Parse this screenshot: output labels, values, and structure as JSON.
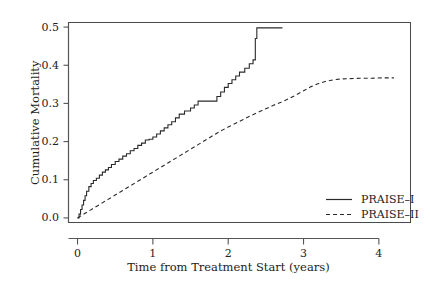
{
  "chart_data": {
    "type": "line",
    "title": "",
    "xlabel": "Time from Treatment Start (years)",
    "ylabel": "Cumulative Mortality",
    "xlim": [
      -0.12,
      4.42
    ],
    "ylim": [
      -0.012,
      0.512
    ],
    "xticks": [
      0,
      1,
      2,
      3,
      4
    ],
    "xticklabels": [
      "0",
      "1",
      "2",
      "3",
      "4"
    ],
    "yticks": [
      0.0,
      0.1,
      0.2,
      0.3,
      0.4,
      0.5
    ],
    "yticklabels": [
      "0.0",
      "0.1",
      "0.2",
      "0.3",
      "0.4",
      "0.5"
    ],
    "grid": false,
    "legend_position": "lower right",
    "frame": true,
    "series": [
      {
        "name": "PRAISE–I",
        "style": "solid",
        "drawstyle": "steps-post",
        "color": "#2a2a2a",
        "points": [
          [
            0.0,
            0.0
          ],
          [
            0.02,
            0.01
          ],
          [
            0.04,
            0.022
          ],
          [
            0.06,
            0.034
          ],
          [
            0.08,
            0.046
          ],
          [
            0.1,
            0.058
          ],
          [
            0.12,
            0.07
          ],
          [
            0.15,
            0.082
          ],
          [
            0.18,
            0.09
          ],
          [
            0.21,
            0.098
          ],
          [
            0.25,
            0.104
          ],
          [
            0.29,
            0.112
          ],
          [
            0.33,
            0.12
          ],
          [
            0.37,
            0.126
          ],
          [
            0.41,
            0.132
          ],
          [
            0.45,
            0.14
          ],
          [
            0.5,
            0.148
          ],
          [
            0.55,
            0.154
          ],
          [
            0.6,
            0.162
          ],
          [
            0.65,
            0.168
          ],
          [
            0.7,
            0.176
          ],
          [
            0.75,
            0.182
          ],
          [
            0.8,
            0.19
          ],
          [
            0.85,
            0.196
          ],
          [
            0.9,
            0.204
          ],
          [
            0.95,
            0.206
          ],
          [
            1.0,
            0.212
          ],
          [
            1.05,
            0.22
          ],
          [
            1.1,
            0.228
          ],
          [
            1.15,
            0.236
          ],
          [
            1.2,
            0.244
          ],
          [
            1.25,
            0.252
          ],
          [
            1.3,
            0.262
          ],
          [
            1.35,
            0.272
          ],
          [
            1.42,
            0.28
          ],
          [
            1.5,
            0.288
          ],
          [
            1.55,
            0.296
          ],
          [
            1.6,
            0.306
          ],
          [
            1.65,
            0.306
          ],
          [
            1.72,
            0.306
          ],
          [
            1.8,
            0.306
          ],
          [
            1.85,
            0.318
          ],
          [
            1.9,
            0.33
          ],
          [
            1.95,
            0.342
          ],
          [
            2.0,
            0.352
          ],
          [
            2.05,
            0.362
          ],
          [
            2.1,
            0.372
          ],
          [
            2.15,
            0.382
          ],
          [
            2.22,
            0.392
          ],
          [
            2.28,
            0.404
          ],
          [
            2.33,
            0.414
          ],
          [
            2.35,
            0.414
          ],
          [
            2.36,
            0.47
          ],
          [
            2.38,
            0.498
          ],
          [
            2.72,
            0.498
          ]
        ]
      },
      {
        "name": "PRAISE–II",
        "style": "dashed",
        "drawstyle": "default",
        "color": "#2a2a2a",
        "points": [
          [
            0.0,
            0.0
          ],
          [
            0.1,
            0.012
          ],
          [
            0.2,
            0.024
          ],
          [
            0.3,
            0.036
          ],
          [
            0.4,
            0.048
          ],
          [
            0.5,
            0.06
          ],
          [
            0.6,
            0.072
          ],
          [
            0.7,
            0.084
          ],
          [
            0.8,
            0.096
          ],
          [
            0.9,
            0.108
          ],
          [
            1.0,
            0.12
          ],
          [
            1.1,
            0.132
          ],
          [
            1.2,
            0.144
          ],
          [
            1.3,
            0.156
          ],
          [
            1.4,
            0.168
          ],
          [
            1.5,
            0.18
          ],
          [
            1.6,
            0.192
          ],
          [
            1.7,
            0.204
          ],
          [
            1.8,
            0.216
          ],
          [
            1.9,
            0.228
          ],
          [
            2.0,
            0.238
          ],
          [
            2.1,
            0.248
          ],
          [
            2.2,
            0.258
          ],
          [
            2.3,
            0.268
          ],
          [
            2.4,
            0.277
          ],
          [
            2.5,
            0.286
          ],
          [
            2.6,
            0.295
          ],
          [
            2.7,
            0.303
          ],
          [
            2.8,
            0.312
          ],
          [
            2.9,
            0.322
          ],
          [
            3.0,
            0.333
          ],
          [
            3.1,
            0.344
          ],
          [
            3.2,
            0.352
          ],
          [
            3.3,
            0.358
          ],
          [
            3.4,
            0.362
          ],
          [
            3.5,
            0.364
          ],
          [
            3.6,
            0.365
          ],
          [
            3.75,
            0.366
          ],
          [
            3.9,
            0.366
          ],
          [
            4.05,
            0.367
          ],
          [
            4.2,
            0.367
          ]
        ]
      }
    ],
    "legend_entries": [
      {
        "label": "PRAISE–I",
        "style": "solid"
      },
      {
        "label": "PRAISE–II",
        "style": "dashed"
      }
    ]
  },
  "colors": {
    "axis": "#555555",
    "frame": "#4a4a4a",
    "line": "#2a2a2a",
    "text": "#1c1c1c",
    "background": "#ffffff"
  }
}
